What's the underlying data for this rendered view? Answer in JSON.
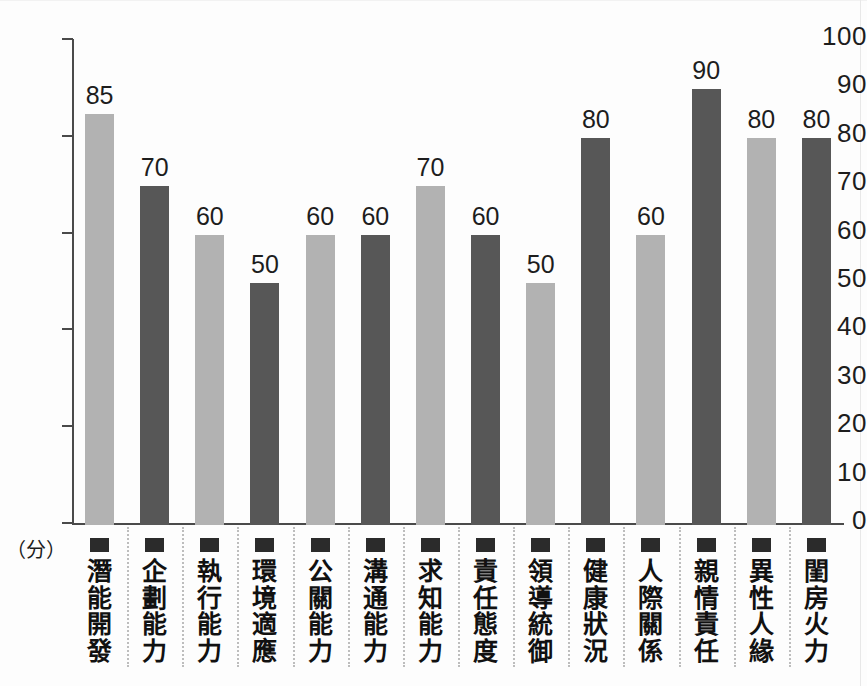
{
  "chart_data": {
    "type": "bar",
    "title": "",
    "subtitle": "",
    "xlabel": "",
    "ylabel": "(分)",
    "ylim": [
      0,
      100
    ],
    "grid": false,
    "legend": "none",
    "categories": [
      "潛能開發",
      "企劃能力",
      "執行能力",
      "環境適應",
      "公關能力",
      "溝通能力",
      "求知能力",
      "責任態度",
      "領導統御",
      "健康狀況",
      "人際關係",
      "親情責任",
      "異性人緣",
      "閨房火力"
    ],
    "values": [
      85,
      70,
      60,
      50,
      60,
      60,
      70,
      60,
      50,
      80,
      60,
      90,
      80,
      80
    ],
    "bar_colors": [
      "#b2b2b2",
      "#575757",
      "#b2b2b2",
      "#575757",
      "#b2b2b2",
      "#575757",
      "#b2b2b2",
      "#575757",
      "#b2b2b2",
      "#575757",
      "#b2b2b2",
      "#575757",
      "#b2b2b2",
      "#575757"
    ],
    "y_ticks": [
      100,
      90,
      80,
      70,
      60,
      50,
      40,
      30,
      20,
      10,
      0
    ],
    "y_ticks_with_marks": [
      100,
      80,
      60,
      40,
      20,
      0
    ],
    "unit_label": "（分）",
    "axis_color": "#4a4a4a",
    "light_color": "#b2b2b2",
    "dark_color": "#575757"
  }
}
